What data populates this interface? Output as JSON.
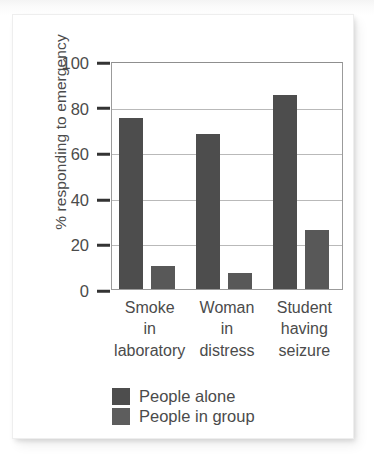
{
  "chart_data": {
    "type": "bar",
    "title": "",
    "xlabel": "",
    "ylabel": "% responding to emergency",
    "ylim": [
      0,
      100
    ],
    "yticks": [
      0,
      20,
      40,
      60,
      80,
      100
    ],
    "ytick_labels": [
      "0",
      "20",
      "40",
      "60",
      "80",
      "100"
    ],
    "grid": true,
    "legend_position": "bottom",
    "categories": [
      [
        "Smoke",
        "in",
        "laboratory"
      ],
      [
        "Woman",
        "in",
        "distress"
      ],
      [
        "Student",
        "having",
        "seizure"
      ]
    ],
    "category_names": [
      "Smoke in laboratory",
      "Woman in distress",
      "Student having seizure"
    ],
    "series": [
      {
        "name": "People alone",
        "color": "#4d4d4d",
        "values": [
          75,
          68,
          85
        ]
      },
      {
        "name": "People in group",
        "color": "#585858",
        "values": [
          10,
          7,
          26
        ]
      }
    ]
  },
  "legend": {
    "items": [
      {
        "label": "People alone",
        "swatch_class": "alone"
      },
      {
        "label": "People in group",
        "swatch_class": "group"
      }
    ]
  },
  "colors": {
    "bar_alone": "#4d4d4d",
    "bar_group": "#585858",
    "gridline": "#b9b9b9",
    "axis": "#9b9b9b",
    "text": "#4b4b4b",
    "background": "#ffffff"
  }
}
